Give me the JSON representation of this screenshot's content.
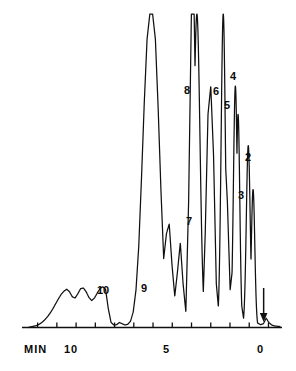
{
  "chart_data": {
    "type": "line",
    "title": "",
    "xlabel": "MIN",
    "ylabel": "",
    "xlim": [
      12.5,
      -0.6
    ],
    "ylim": [
      0,
      100
    ],
    "grid": false,
    "legend": false,
    "axis_direction": "reversed",
    "xticks": [
      12,
      11,
      10,
      9,
      8,
      7,
      6,
      5,
      4,
      3,
      2,
      1,
      0
    ],
    "xtick_labels": [
      "",
      "",
      "10",
      "",
      "",
      "",
      "",
      "5",
      "",
      "",
      "",
      "",
      "0"
    ],
    "x_axis_unit_label": "MIN",
    "annotations": [
      {
        "name": "injection-arrow",
        "x": 0.25,
        "direction": "down",
        "label": ""
      }
    ],
    "peaks": [
      {
        "id": "2",
        "label": "2",
        "x": 1.05,
        "height": 58,
        "width": 0.1,
        "clipped": false
      },
      {
        "id": "3",
        "label": "3",
        "x": 0.8,
        "height": 44,
        "width": 0.09,
        "clipped": false
      },
      {
        "id": "4",
        "label": "4",
        "x": 1.72,
        "height": 77,
        "width": 0.1,
        "clipped": false
      },
      {
        "id": "5",
        "label": "5",
        "x": 1.58,
        "height": 68,
        "width": 0.09,
        "clipped": false
      },
      {
        "id": "6",
        "label": "6",
        "x": 2.35,
        "height": 100,
        "width": 0.11,
        "clipped": true
      },
      {
        "id": "7",
        "label": "7",
        "x": 3.1,
        "height": 33,
        "width": 0.13,
        "clipped": false
      },
      {
        "id": "8",
        "label": "8",
        "x": 3.72,
        "height": 100,
        "width": 0.16,
        "clipped": true
      },
      {
        "id": "9",
        "label": "9",
        "x": 6.95,
        "height": 13,
        "width": 0.6,
        "clipped": false
      },
      {
        "id": "10",
        "label": "10",
        "x": 8.55,
        "height": 13,
        "width": 0.6,
        "clipped": false
      }
    ],
    "series": [
      {
        "name": "detector-signal",
        "values": [
          0.0,
          0.2,
          0.4,
          0.6,
          1.0,
          1.6,
          2.4,
          3.4,
          4.6,
          6.0,
          7.6,
          9.2,
          10.6,
          11.6,
          12.2,
          11.4,
          9.8,
          9.4,
          10.8,
          12.4,
          12.6,
          11.4,
          9.6,
          8.6,
          9.4,
          11.0,
          12.4,
          13.0,
          12.2,
          6.0,
          1.6,
          0.8,
          0.9,
          1.6,
          1.2,
          0.8,
          1.0,
          2.0,
          5.0,
          12.0,
          26.0,
          48.0,
          72.0,
          92.0,
          100.0,
          100.0,
          92.0,
          70.0,
          44.0,
          22.0,
          30.0,
          33.0,
          20.0,
          10.0,
          18.0,
          27.0,
          14.0,
          5.0,
          40.0,
          100.0,
          100.0,
          46.0,
          10.0,
          3.0,
          30.0,
          68.0,
          77.0,
          55.0,
          14.0,
          4.0,
          24.0,
          58.0,
          40.0,
          12.0,
          20.0,
          44.0,
          30.0,
          8.0,
          2.0,
          1.0,
          0.6,
          0.4,
          0.8,
          1.4,
          0.9,
          1.2,
          3.0,
          1.6,
          0.8,
          0.5,
          0.4,
          0.3
        ]
      }
    ]
  },
  "axis": {
    "min_label": "MIN",
    "tick_10": "10",
    "tick_5": "5",
    "tick_0": "0"
  },
  "labels": {
    "p2": "2",
    "p3": "3",
    "p4": "4",
    "p5": "5",
    "p6": "6",
    "p7": "7",
    "p8": "8",
    "p9": "9",
    "p10": "10"
  },
  "colors": {
    "trace": "#101010",
    "axis": "#101010",
    "background": "#ffffff",
    "text": "#0a0a0a"
  }
}
